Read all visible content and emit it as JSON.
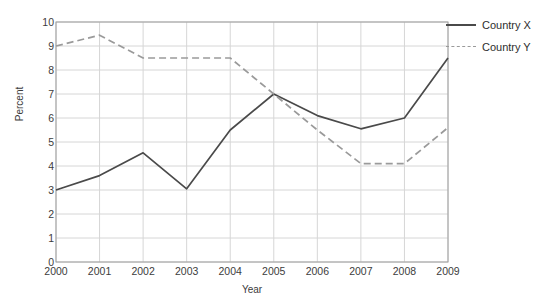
{
  "chart_data": {
    "type": "line",
    "title": "",
    "xlabel": "Year",
    "ylabel": "Percent",
    "categories": [
      "2000",
      "2001",
      "2002",
      "2003",
      "2004",
      "2005",
      "2006",
      "2007",
      "2008",
      "2009"
    ],
    "x": [
      2000,
      2001,
      2002,
      2003,
      2004,
      2005,
      2006,
      2007,
      2008,
      2009
    ],
    "xlim": [
      2000,
      2009
    ],
    "ylim": [
      0,
      10
    ],
    "ytick_step": 1,
    "yticks": [
      "10",
      "9",
      "8",
      "7",
      "6",
      "5",
      "4",
      "3",
      "2",
      "1",
      "0"
    ],
    "grid": true,
    "legend_position": "right",
    "series": [
      {
        "name": "Country X",
        "style": "solid",
        "color": "#4a4a4a",
        "values": [
          3.0,
          3.6,
          4.55,
          3.05,
          5.5,
          7.0,
          6.1,
          5.55,
          6.0,
          8.5
        ]
      },
      {
        "name": "Country Y",
        "style": "dashed",
        "color": "#9a9a9a",
        "values": [
          9.0,
          9.45,
          8.5,
          8.5,
          8.5,
          7.0,
          5.5,
          4.1,
          4.1,
          5.6
        ]
      }
    ]
  },
  "legend": {
    "items": [
      {
        "label": "Country X"
      },
      {
        "label": "Country Y"
      }
    ]
  },
  "axes": {
    "y_title": "Percent",
    "x_title": "Year"
  }
}
